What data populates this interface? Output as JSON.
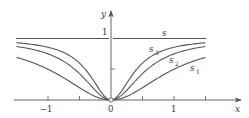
{
  "figure": {
    "type": "function-sequence-plot",
    "axes": {
      "x_label": "x",
      "y_label": "y",
      "origin_label": "0",
      "x_ticks": [
        {
          "value": -1,
          "label": "−1"
        },
        {
          "value": -0.5,
          "label": ""
        },
        {
          "value": 0.5,
          "label": ""
        },
        {
          "value": 1,
          "label": "1"
        },
        {
          "value": 1.5,
          "label": ""
        }
      ],
      "y_ticks": [
        {
          "value": 0.5,
          "label": ""
        },
        {
          "value": 1,
          "label": "1"
        }
      ],
      "xlim": [
        -1.5,
        1.5
      ],
      "ylim": [
        0,
        1
      ]
    },
    "curves": [
      {
        "name": "s",
        "label": "s",
        "description": "limit function, y=1 except at x=0 (open point at origin)"
      },
      {
        "name": "s3",
        "label": "s",
        "sub": "3",
        "n": 6
      },
      {
        "name": "s2",
        "label": "s",
        "sub": "2",
        "n": 3
      },
      {
        "name": "s1",
        "label": "s",
        "sub": "1",
        "n": 1
      }
    ],
    "colors": {
      "axis": "#555555",
      "curve": "#555555"
    }
  }
}
